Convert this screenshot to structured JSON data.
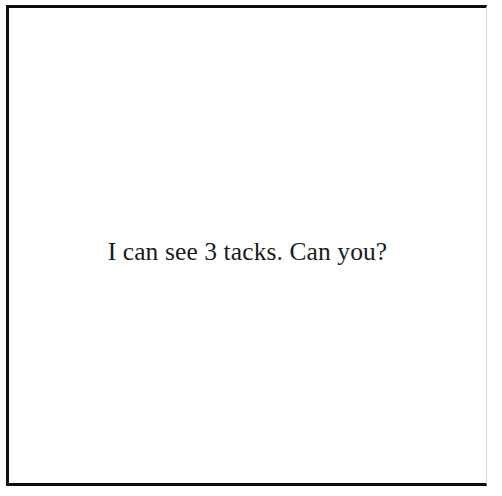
{
  "page": {
    "background_color": "#ffffff",
    "surface_color": "#ffffff"
  },
  "frame": {
    "border_color": "#0d0d0d",
    "right_edge_color": "#d8d8d8",
    "description": "rectangular drawn border"
  },
  "caption": {
    "text": "I can see 3 tacks. Can you?",
    "color": "#1a1a1a",
    "count_mentioned": "3",
    "subject": "tacks"
  },
  "content": {
    "visible_objects": [],
    "object_count": "0",
    "note": "blank white field"
  }
}
